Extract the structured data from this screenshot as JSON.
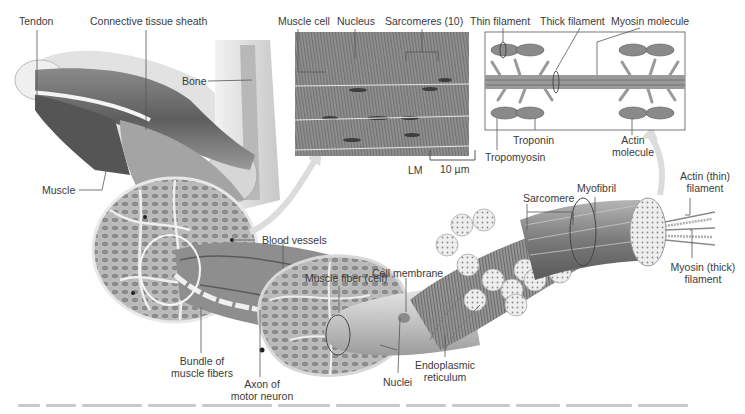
{
  "figure": {
    "labels": {
      "tendon": "Tendon",
      "connective_tissue_sheath": "Connective tissue sheath",
      "bone": "Bone",
      "muscle": "Muscle",
      "blood_vessels": "Blood vessels",
      "bundle_of_muscle_fibers": [
        "Bundle of",
        "muscle fibers"
      ],
      "axon_of_motor_neuron": [
        "Axon of",
        "motor neuron"
      ],
      "muscle_fiber_cell": "Muscle fiber (cell)",
      "cell_membrane": "Cell membrane",
      "nuclei": "Nuclei",
      "endoplasmic_reticulum": [
        "Endoplasmic",
        "reticulum"
      ],
      "sarcomere": "Sarcomere",
      "myofibril": "Myofibril",
      "actin_thin_filament": [
        "Actin (thin)",
        "filament"
      ],
      "myosin_thick_filament": [
        "Myosin (thick)",
        "filament"
      ]
    },
    "micrograph_inset": {
      "labels": {
        "muscle_cell": "Muscle cell",
        "nucleus": "Nucleus",
        "sarcomeres": "Sarcomeres (10)"
      },
      "technique": "LM",
      "scale_bar": "10 µm"
    },
    "filament_inset": {
      "labels": {
        "thin_filament": "Thin filament",
        "thick_filament": "Thick filament",
        "myosin_molecule": "Myosin molecule",
        "troponin": "Troponin",
        "tropomyosin": "Tropomyosin",
        "actin_molecule": [
          "Actin",
          "molecule"
        ]
      }
    },
    "colors": {
      "background": "#ffffff",
      "label_text": "#3a3a3a",
      "leader_line": "#555555",
      "muscle_dark": "#6e6e6e",
      "muscle_mid": "#a8a8a8",
      "muscle_light": "#dcdcdc",
      "arrow": "#d8d8d8"
    }
  }
}
